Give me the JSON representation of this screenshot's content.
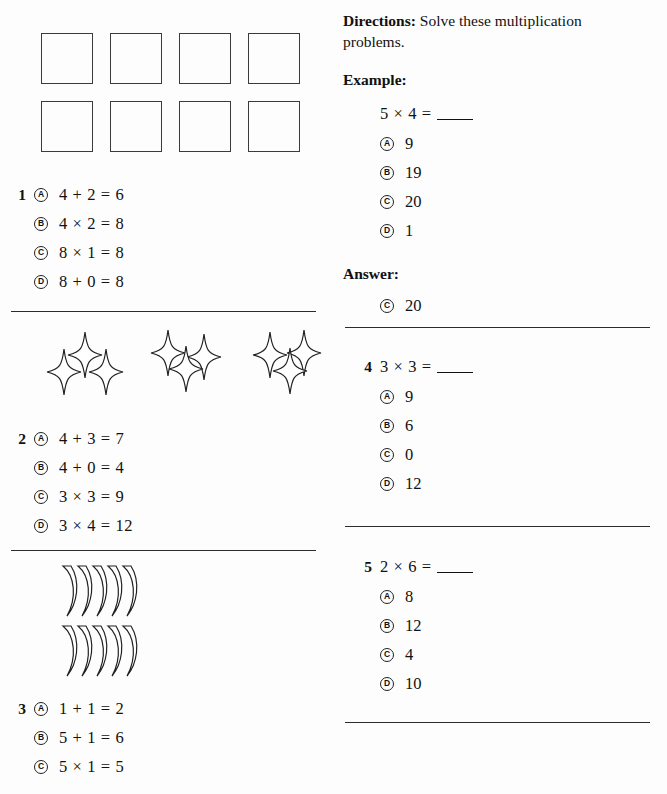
{
  "worksheet": {
    "directions_label": "Directions:",
    "directions_text": "Solve these multiplication problems.",
    "example_label": "Example:",
    "answer_label": "Answer:"
  },
  "example": {
    "stem": "5 × 4 =",
    "options": [
      {
        "letter": "A",
        "value": "9"
      },
      {
        "letter": "B",
        "value": "19"
      },
      {
        "letter": "C",
        "value": "20"
      },
      {
        "letter": "D",
        "value": "1"
      }
    ],
    "answer": {
      "letter": "C",
      "value": "20"
    }
  },
  "questions": [
    {
      "number": "1",
      "illustration": "eight-squares",
      "options": [
        {
          "letter": "A",
          "text": "4 + 2 = 6"
        },
        {
          "letter": "B",
          "text": "4 × 2 = 8"
        },
        {
          "letter": "C",
          "text": "8 × 1 = 8"
        },
        {
          "letter": "D",
          "text": "8 + 0 = 8"
        }
      ]
    },
    {
      "number": "2",
      "illustration": "nine-stars",
      "options": [
        {
          "letter": "A",
          "text": "4 + 3 = 7"
        },
        {
          "letter": "B",
          "text": "4 + 0 = 4"
        },
        {
          "letter": "C",
          "text": "3 × 3 = 9"
        },
        {
          "letter": "D",
          "text": "3 × 4 = 12"
        }
      ]
    },
    {
      "number": "3",
      "illustration": "ten-bananas",
      "options": [
        {
          "letter": "A",
          "text": "1 + 1 = 2"
        },
        {
          "letter": "B",
          "text": "5 + 1 = 6"
        },
        {
          "letter": "C",
          "text": "5 × 1 = 5"
        }
      ]
    },
    {
      "number": "4",
      "stem": "3 × 3 =",
      "options": [
        {
          "letter": "A",
          "text": "9"
        },
        {
          "letter": "B",
          "text": "6"
        },
        {
          "letter": "C",
          "text": "0"
        },
        {
          "letter": "D",
          "text": "12"
        }
      ]
    },
    {
      "number": "5",
      "stem": "2 × 6 =",
      "options": [
        {
          "letter": "A",
          "text": "8"
        },
        {
          "letter": "B",
          "text": "12"
        },
        {
          "letter": "C",
          "text": "4"
        },
        {
          "letter": "D",
          "text": "10"
        }
      ]
    }
  ],
  "illustrations": {
    "squares_count": 8,
    "star_groups": 3,
    "stars_per_group": 3,
    "banana_rows": 2,
    "bananas_per_row": 5
  },
  "colors": {
    "ink": "#111111",
    "rule": "#2c2c2c",
    "paper": "#fdfdfd"
  }
}
